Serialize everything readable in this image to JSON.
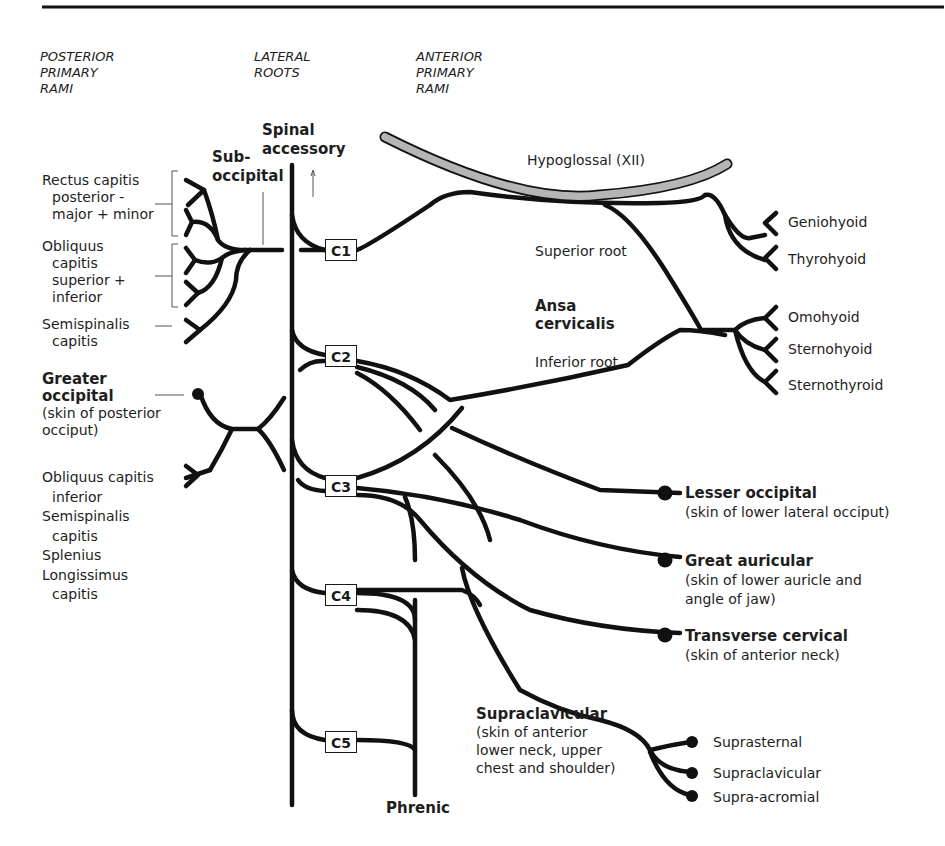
{
  "headers": {
    "posterior": [
      "POSTERIOR",
      "PRIMARY",
      "RAMI"
    ],
    "lateral": [
      "LATERAL",
      "ROOTS"
    ],
    "anterior": [
      "ANTERIOR",
      "PRIMARY",
      "RAMI"
    ]
  },
  "top_labels": {
    "spinal_accessory": [
      "Spinal",
      "accessory"
    ],
    "suboccipital": [
      "Sub-",
      "occipital"
    ],
    "hypoglossal": "Hypoglossal (XII)"
  },
  "roots": [
    "C1",
    "C2",
    "C3",
    "C4",
    "C5"
  ],
  "posterior_muscles": {
    "rectus": [
      "Rectus capitis",
      "posterior -",
      "major + minor"
    ],
    "obliquus_sup_inf": [
      "Obliquus",
      "capitis",
      "superior +",
      "inferior"
    ],
    "semispinalis": [
      "Semispinalis",
      "capitis"
    ],
    "greater_occipital": {
      "title": [
        "Greater",
        "occipital"
      ],
      "desc": [
        "(skin of posterior",
        "occiput)"
      ]
    },
    "lower_group": [
      "Obliquus capitis",
      "inferior",
      "Semispinalis",
      "capitis",
      "Splenius",
      "Longissimus",
      "capitis"
    ]
  },
  "ansa": {
    "superior_root": "Superior root",
    "inferior_root": "Inferior root",
    "title": [
      "Ansa",
      "cervicalis"
    ]
  },
  "hyoid_muscles": [
    "Geniohyoid",
    "Thyrohyoid",
    "Omohyoid",
    "Sternohyoid",
    "Sternothyroid"
  ],
  "cutaneous": {
    "lesser_occipital": {
      "title": "Lesser occipital",
      "desc": [
        "(skin of lower lateral occiput)"
      ]
    },
    "great_auricular": {
      "title": "Great auricular",
      "desc": [
        "(skin of lower auricle and",
        "angle of jaw)"
      ]
    },
    "transverse_cervical": {
      "title": "Transverse cervical",
      "desc": [
        "(skin of anterior neck)"
      ]
    },
    "supraclavicular": {
      "title": "Supraclavicular",
      "desc": [
        "(skin of anterior",
        "lower neck, upper",
        "chest and shoulder)"
      ]
    }
  },
  "supraclavicular_branches": [
    "Suprasternal",
    "Supraclavicular",
    "Supra-acromial"
  ],
  "phrenic": "Phrenic",
  "colors": {
    "line": "#111111",
    "hypoglossal_fill": "#b5b5b5",
    "text": "#1e1e1e"
  }
}
